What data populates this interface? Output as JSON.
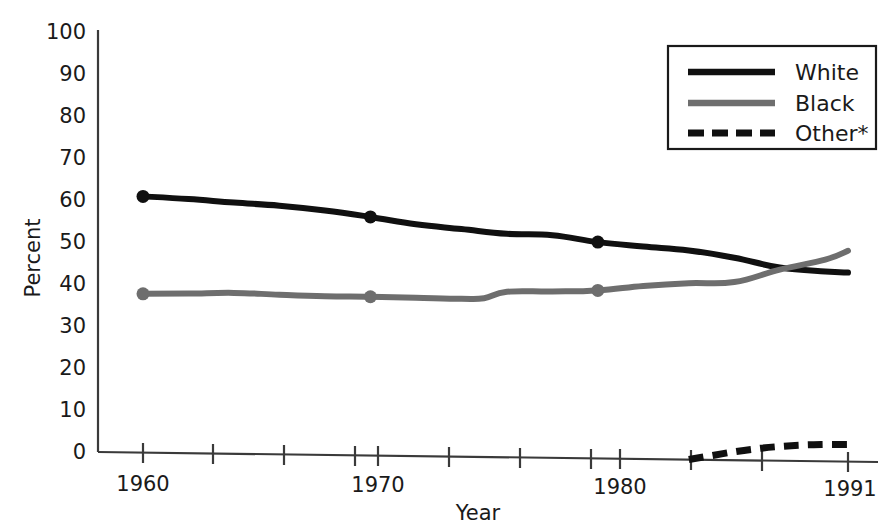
{
  "chart_data": {
    "type": "line",
    "title": "",
    "xlabel": "Year",
    "ylabel": "Percent",
    "ylim": [
      0,
      100
    ],
    "xlim": [
      1959,
      1991
    ],
    "grid": false,
    "legend_position": "top-right",
    "y_ticks": [
      "0",
      "10",
      "20",
      "30",
      "40",
      "50",
      "60",
      "70",
      "80",
      "90",
      "100"
    ],
    "y_tick_values": [
      0,
      10,
      20,
      30,
      40,
      50,
      60,
      70,
      80,
      90,
      100
    ],
    "x_ticks_labeled": [
      "1960",
      "1970",
      "1980",
      "1991"
    ],
    "x_tick_values_labeled": [
      1960,
      1970,
      1980,
      1991
    ],
    "x_tick_values_all": [
      1960,
      1963,
      1966,
      1969,
      1972,
      1975,
      1978,
      1981,
      1984,
      1987,
      1991
    ],
    "marker_years": [
      1960,
      1970,
      1980
    ],
    "series": [
      {
        "name": "White",
        "color": "#101010",
        "style": "solid",
        "x": [
          1960,
          1962,
          1964,
          1966,
          1968,
          1970,
          1972,
          1974,
          1976,
          1978,
          1980,
          1982,
          1984,
          1986,
          1988,
          1990,
          1991
        ],
        "values": [
          61,
          60.5,
          59.8,
          59.2,
          58.2,
          56.8,
          55.2,
          54.2,
          53.2,
          53.0,
          51.5,
          50.6,
          49.8,
          48.2,
          46.0,
          45.2,
          45.0
        ]
      },
      {
        "name": "Black",
        "color": "#6e6e6e",
        "style": "solid",
        "x": [
          1960,
          1962,
          1964,
          1966,
          1968,
          1970,
          1972,
          1974,
          1975,
          1976,
          1978,
          1980,
          1982,
          1984,
          1986,
          1988,
          1990,
          1991
        ],
        "values": [
          37.8,
          38.0,
          38.3,
          38.0,
          37.8,
          37.8,
          37.7,
          37.6,
          37.8,
          39.4,
          39.6,
          40.0,
          41.2,
          42.0,
          42.4,
          45.5,
          48.0,
          50.2
        ]
      },
      {
        "name": "Other*",
        "color": "#101010",
        "style": "dashed",
        "x": [
          1984,
          1985,
          1986,
          1987,
          1988,
          1989,
          1990,
          1991
        ],
        "values": [
          0,
          1.0,
          2.0,
          2.8,
          3.4,
          3.8,
          4.0,
          4.1
        ]
      }
    ],
    "legend": [
      {
        "label": "White",
        "color": "#101010",
        "style": "solid"
      },
      {
        "label": "Black",
        "color": "#6e6e6e",
        "style": "solid"
      },
      {
        "label": "Other*",
        "color": "#101010",
        "style": "dashed"
      }
    ]
  }
}
